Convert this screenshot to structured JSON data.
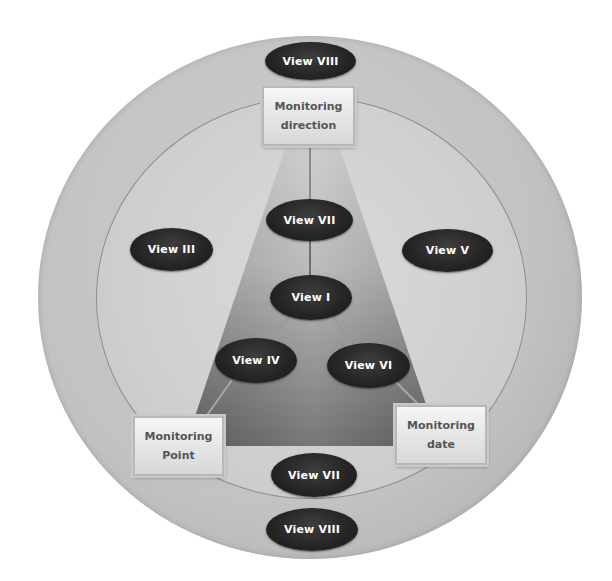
{
  "diagram": {
    "type": "concentric-view-diagram",
    "colors": {
      "outer_ring": "#c2c2c2",
      "inner_circle": "#cfcfcf",
      "trapezoid_top": "#c4c4c4",
      "trapezoid_bottom": "#6a6a6a",
      "view_ellipse": "#262626",
      "view_text": "#ffffff",
      "box_text": "#555555"
    },
    "boxes": {
      "direction": {
        "line1": "Monitoring",
        "line2": "direction"
      },
      "point": {
        "line1": "Monitoring",
        "line2": "Point"
      },
      "date": {
        "line1": "Monitoring",
        "line2": "date"
      }
    },
    "views": {
      "top_outer": "View VIII",
      "upper_center": "View VII",
      "left": "View III",
      "right": "View V",
      "center": "View I",
      "lower_left": "View IV",
      "lower_right": "View VI",
      "bottom_inner": "View VII",
      "bottom_outer": "View VIII"
    }
  }
}
